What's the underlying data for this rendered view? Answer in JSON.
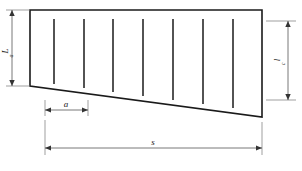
{
  "diagram": {
    "background_color": "#ffffff",
    "line_color": "#1a1a1a",
    "dimension_color": "#555555",
    "labels": {
      "left_height": "L",
      "left_height_sub": "a",
      "right_height": "l",
      "right_height_sub": "c",
      "spacing": "a",
      "span": "s"
    },
    "shape": {
      "name": "trapezoid-body",
      "top_left": [
        30,
        10
      ],
      "top_right": [
        262,
        10
      ],
      "bottom_right": [
        262,
        117
      ],
      "bottom_left": [
        30,
        86
      ]
    },
    "tick_lines": [
      {
        "x": 54,
        "y_top": 19,
        "y_bottom": 84
      },
      {
        "x": 84,
        "y_top": 19,
        "y_bottom": 88
      },
      {
        "x": 113,
        "y_top": 19,
        "y_bottom": 92
      },
      {
        "x": 143,
        "y_top": 19,
        "y_bottom": 96
      },
      {
        "x": 173,
        "y_top": 19,
        "y_bottom": 100
      },
      {
        "x": 203,
        "y_top": 19,
        "y_bottom": 104
      },
      {
        "x": 233,
        "y_top": 19,
        "y_bottom": 108
      }
    ],
    "dimensions": {
      "left_vertical": {
        "x": 12,
        "y_top": 10,
        "y_bottom": 86
      },
      "right_vertical": {
        "x": 288,
        "y_top": 21,
        "y_bottom": 100
      },
      "spacing_horizontal": {
        "y": 110,
        "x_start": 45,
        "x_end": 88
      },
      "span_horizontal": {
        "y": 148,
        "x_start": 45,
        "x_end": 262
      }
    }
  }
}
